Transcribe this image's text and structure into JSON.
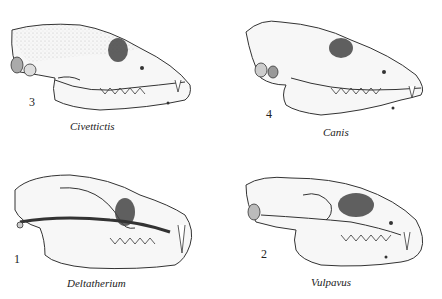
{
  "figure": {
    "panels": [
      {
        "number": "3",
        "genus": "Civettictis",
        "position": "top-left"
      },
      {
        "number": "4",
        "genus": "Canis",
        "position": "top-right"
      },
      {
        "number": "1",
        "genus": "Deltatherium",
        "position": "bottom-left"
      },
      {
        "number": "2",
        "genus": "Vulpavus",
        "position": "bottom-right"
      }
    ]
  }
}
